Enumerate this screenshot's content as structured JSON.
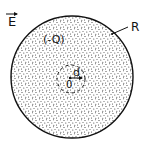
{
  "diagram": {
    "field_label": "E",
    "charge_label": "(-Q)",
    "radius_label": "R",
    "displacement_label": "d",
    "center_label": "0",
    "colors": {
      "stroke": "#111111",
      "fill_dots": "#333333",
      "background": "#ffffff"
    },
    "sphere": {
      "cx": 72,
      "cy": 77,
      "r": 61
    },
    "inner_circle": {
      "cx": 71,
      "cy": 79,
      "r": 14
    }
  }
}
